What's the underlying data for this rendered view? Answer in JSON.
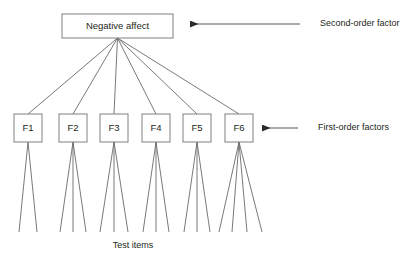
{
  "diagram": {
    "type": "hierarchical-factor-model",
    "second_order": {
      "label": "Negative affect",
      "box": {
        "x": 62,
        "y": 14,
        "w": 111,
        "h": 24
      }
    },
    "first_order": [
      {
        "label": "F1",
        "box": {
          "x": 14,
          "y": 114,
          "w": 28,
          "h": 28
        },
        "indicators": 2
      },
      {
        "label": "F2",
        "box": {
          "x": 59,
          "y": 114,
          "w": 28,
          "h": 28
        },
        "indicators": 3
      },
      {
        "label": "F3",
        "box": {
          "x": 100,
          "y": 114,
          "w": 28,
          "h": 28
        },
        "indicators": 3
      },
      {
        "label": "F4",
        "box": {
          "x": 142,
          "y": 114,
          "w": 28,
          "h": 28
        },
        "indicators": 3
      },
      {
        "label": "F5",
        "box": {
          "x": 183,
          "y": 114,
          "w": 28,
          "h": 28
        },
        "indicators": 3
      },
      {
        "label": "F6",
        "box": {
          "x": 225,
          "y": 114,
          "w": 28,
          "h": 28
        },
        "indicators": 4
      }
    ],
    "annotations": [
      {
        "name": "second-order-factor",
        "text": "Second-order factor",
        "text_x": 320,
        "text_y": 24,
        "arrow_from_x": 300,
        "arrow_to_x": 190,
        "arrow_y": 24
      },
      {
        "name": "first-order-factors",
        "text": "First-order factors",
        "text_x": 318,
        "text_y": 128,
        "arrow_from_x": 298,
        "arrow_to_x": 262,
        "arrow_y": 128
      }
    ],
    "caption": {
      "text": "Test items",
      "x": 133,
      "y": 246
    },
    "colors": {
      "stroke": "#808080",
      "line": "#6a6a6a",
      "text": "#231f20",
      "arrow": "#58595b",
      "background": "#ffffff"
    }
  }
}
